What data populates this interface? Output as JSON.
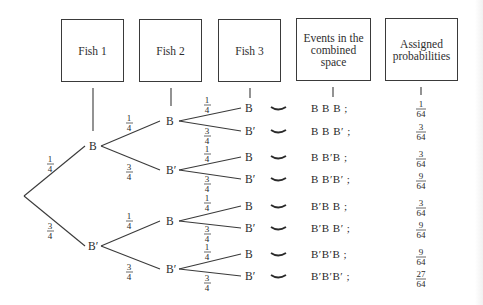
{
  "headers": {
    "fish1": "Fish 1",
    "fish2": "Fish 2",
    "fish3": "Fish 3",
    "events_line1": "Events in the",
    "events_line2": "combined space",
    "prob_line1": "Assigned",
    "prob_line2": "probabilities"
  },
  "tree": {
    "root_branches": [
      {
        "node": "B",
        "prob_num": "1",
        "prob_den": "4"
      },
      {
        "node": "B′",
        "prob_num": "3",
        "prob_den": "4"
      }
    ],
    "level2": [
      {
        "node": "B",
        "prob_num": "1",
        "prob_den": "4"
      },
      {
        "node": "B′",
        "prob_num": "3",
        "prob_den": "4"
      },
      {
        "node": "B",
        "prob_num": "1",
        "prob_den": "4"
      },
      {
        "node": "B′",
        "prob_num": "3",
        "prob_den": "4"
      }
    ],
    "level3": [
      {
        "node": "B",
        "prob_num": "1",
        "prob_den": "4"
      },
      {
        "node": "B′",
        "prob_num": "3",
        "prob_den": "4"
      },
      {
        "node": "B",
        "prob_num": "1",
        "prob_den": "4"
      },
      {
        "node": "B′",
        "prob_num": "3",
        "prob_den": "4"
      },
      {
        "node": "B",
        "prob_num": "1",
        "prob_den": "4"
      },
      {
        "node": "B′",
        "prob_num": "3",
        "prob_den": "4"
      },
      {
        "node": "B",
        "prob_num": "1",
        "prob_den": "4"
      },
      {
        "node": "B′",
        "prob_num": "3",
        "prob_den": "4"
      }
    ]
  },
  "outcomes": [
    {
      "event": "B B B ;",
      "prob_num": "1",
      "prob_den": "64"
    },
    {
      "event": "B B B′ ;",
      "prob_num": "3",
      "prob_den": "64"
    },
    {
      "event": "B B′B ;",
      "prob_num": "3",
      "prob_den": "64"
    },
    {
      "event": "B B′B′ ;",
      "prob_num": "9",
      "prob_den": "64"
    },
    {
      "event": "B′B B ;",
      "prob_num": "3",
      "prob_den": "64"
    },
    {
      "event": "B′B B′ ;",
      "prob_num": "9",
      "prob_den": "64"
    },
    {
      "event": "B′B′B ;",
      "prob_num": "9",
      "prob_den": "64"
    },
    {
      "event": "B′B′B′ ;",
      "prob_num": "27",
      "prob_den": "64"
    }
  ],
  "colors": {
    "line": "#3a3a3a",
    "text": "#2a2a2a",
    "background": "#ffffff"
  }
}
